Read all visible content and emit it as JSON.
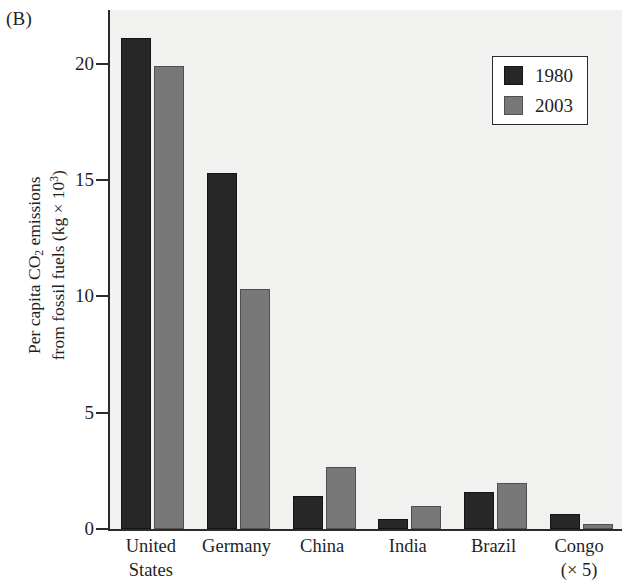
{
  "panel": {
    "label": "(B)"
  },
  "chart_data": {
    "type": "bar",
    "title": "",
    "subtitle": "",
    "xlabel": "",
    "ylabel_lines": [
      "Per capita CO2 emissions",
      "from fossil fuels (kg x 10^3)"
    ],
    "ylabel_html_line1_pre": "Per capita CO",
    "ylabel_html_line1_sub": "2",
    "ylabel_html_line1_post": " emissions",
    "ylabel_html_line2_pre": "from fossil fuels (kg × 10",
    "ylabel_html_line2_sup": "3",
    "ylabel_html_line2_post": ")",
    "ylim": [
      0,
      22.3
    ],
    "yticks": [
      0,
      5,
      10,
      15,
      20
    ],
    "ytick_labels": [
      "0",
      "5",
      "10",
      "15",
      "20"
    ],
    "grid": false,
    "legend_position": "top-right",
    "categories": [
      "United States",
      "Germany",
      "China",
      "India",
      "Brazil",
      "Congo (× 5)"
    ],
    "category_lines": [
      [
        "United",
        "States"
      ],
      [
        "Germany",
        ""
      ],
      [
        "China",
        ""
      ],
      [
        "India",
        ""
      ],
      [
        "Brazil",
        ""
      ],
      [
        "Congo",
        "(× 5)"
      ]
    ],
    "series": [
      {
        "name": "1980",
        "color": "#272727",
        "values": [
          21.1,
          15.3,
          1.4,
          0.42,
          1.58,
          0.64
        ]
      },
      {
        "name": "2003",
        "color": "#787878",
        "values": [
          19.9,
          10.3,
          2.65,
          1.0,
          1.97,
          0.22
        ]
      }
    ]
  },
  "legend": {
    "entries": [
      {
        "label": "1980",
        "color": "#272727"
      },
      {
        "label": "2003",
        "color": "#787878"
      }
    ]
  },
  "colors": {
    "series_1980": "#272727",
    "series_2003": "#787878",
    "plot_background": "#f1f1f0",
    "axis": "#2b2b2b",
    "page_background": "#ffffff"
  }
}
